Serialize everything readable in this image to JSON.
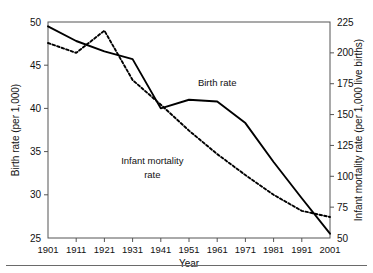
{
  "chart_data": {
    "type": "line",
    "title": "",
    "xlabel": "Year",
    "ylabel": "Birth rate (per 1,000)",
    "y2label": "Infant mortality rate (per 1,000 live births)",
    "x": [
      1901,
      1911,
      1921,
      1931,
      1941,
      1951,
      1961,
      1971,
      1981,
      1991,
      2001
    ],
    "categories": [
      "1901",
      "1911",
      "1921",
      "1931",
      "1941",
      "1951",
      "1961",
      "1971",
      "1981",
      "1991",
      "2001"
    ],
    "xlim": [
      1901,
      2001
    ],
    "ylim": [
      25,
      50
    ],
    "y2lim": [
      50,
      225
    ],
    "yticks": [
      25,
      30,
      35,
      40,
      45,
      50
    ],
    "ytick_labels": [
      "25",
      "30",
      "35",
      "40",
      "45",
      "50"
    ],
    "y2ticks": [
      50,
      75,
      100,
      125,
      150,
      175,
      200,
      225
    ],
    "y2tick_labels": [
      "50",
      "75",
      "100",
      "125",
      "150",
      "175",
      "200",
      "225"
    ],
    "grid": false,
    "legend": "inline-annotations",
    "series": [
      {
        "name": "Birth rate",
        "axis": "left",
        "style": "solid",
        "units": "per 1,000",
        "values": [
          49.5,
          47.8,
          46.6,
          45.7,
          40.0,
          41.0,
          40.8,
          38.3,
          33.8,
          29.6,
          25.5
        ]
      },
      {
        "name": "Infant mortality rate",
        "axis": "right",
        "style": "dotted",
        "units": "per 1,000 live births",
        "values": [
          208,
          200,
          218,
          178,
          158,
          137,
          118,
          101,
          85,
          72,
          67
        ]
      }
    ],
    "annotations": [
      {
        "name": "birth-rate-label",
        "text": "Birth rate",
        "x": 1961,
        "y": 42.6
      },
      {
        "name": "infant-mortality-label-line1",
        "text": "Infant mortality",
        "x": 1938,
        "y": 33.6
      },
      {
        "name": "infant-mortality-label-line2",
        "text": "rate",
        "x": 1938,
        "y": 32.0
      }
    ],
    "colors": {
      "series_line": "#000000",
      "axis": "#555555",
      "text": "#111111",
      "background": "#ffffff"
    }
  }
}
